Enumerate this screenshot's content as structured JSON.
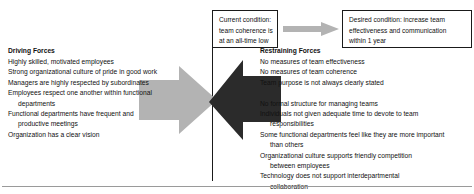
{
  "diagram": {
    "type": "force-field-analysis",
    "colors": {
      "driving_arrow": "#b3b3b3",
      "restraining_arrow": "#2b2b2b",
      "transition_arrow": "#b3b3b3",
      "divider": "#1a1a1a",
      "box_border": "#1a1a1a",
      "text": "#111111",
      "bottom_rule": "#9a9a9a"
    }
  },
  "current_condition": {
    "lines": [
      "Current condition:",
      "team coherence is",
      "at an all-time low"
    ]
  },
  "desired_condition": {
    "lines": [
      "Desired condition: increase team",
      "effectiveness and communication",
      "within 1 year"
    ]
  },
  "driving": {
    "heading": "Driving Forces",
    "items": [
      {
        "text": "Highly skilled, motivated employees",
        "cont": ""
      },
      {
        "text": "Strong organizational culture of pride in good work",
        "cont": ""
      },
      {
        "text": "Managers are highly respected by subordinates",
        "cont": ""
      },
      {
        "text": "Employees respect one another within functional",
        "cont": "departments"
      },
      {
        "text": "Functional departments have frequent and",
        "cont": "productive meetings"
      },
      {
        "text": "Organization has a clear vision",
        "cont": ""
      }
    ]
  },
  "restraining": {
    "heading": "Restraining Forces",
    "items_group_1": [
      {
        "text": "No measures of team effectiveness",
        "cont": ""
      },
      {
        "text": "No measures of team coherence",
        "cont": ""
      },
      {
        "text": "Team purpose is not always clearly stated",
        "cont": ""
      }
    ],
    "items_group_2": [
      {
        "text": "No formal structure for managing teams",
        "cont": ""
      },
      {
        "text": "Individuals not given adequate time to devote to team",
        "cont": "responsibilities"
      },
      {
        "text": "Some functional departments feel like they are more important",
        "cont": "than others"
      },
      {
        "text": "Organizational culture supports friendly competition",
        "cont": "between employees"
      },
      {
        "text": "Technology does not support interdepartmental",
        "cont": "collaboration"
      }
    ]
  },
  "icons": {
    "driving_arrow": "right-block-arrow-icon",
    "restraining_arrow": "left-block-arrow-icon",
    "transition_arrow": "right-arrow-icon"
  }
}
